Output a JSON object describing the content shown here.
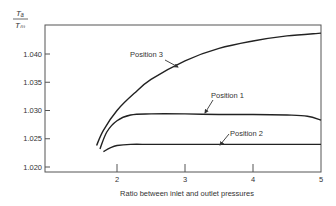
{
  "chart_data": {
    "type": "line",
    "title": "",
    "ylabel_numerator": "Tₐ",
    "ylabel_denominator": "Tₘ",
    "xlabel": "Ratio between inlet and outlet pressures",
    "xlim": [
      1,
      5
    ],
    "ylim": [
      1.02,
      1.046
    ],
    "x_ticks": [
      2,
      3,
      4,
      5
    ],
    "x_tick_labels": [
      "2",
      "3",
      "4",
      "5"
    ],
    "y_ticks": [
      1.02,
      1.025,
      1.03,
      1.035,
      1.04
    ],
    "y_tick_labels": [
      "1.020",
      "1.025",
      "1.030",
      "1.035",
      "1.040"
    ],
    "grid": false,
    "legend": "inline annotations with arrows",
    "series": [
      {
        "name": "Position 3",
        "x": [
          1.7,
          1.8,
          2.0,
          2.25,
          2.5,
          3.0,
          3.5,
          4.0,
          4.5,
          5.0
        ],
        "y": [
          1.0238,
          1.0265,
          1.03,
          1.033,
          1.0355,
          1.0388,
          1.041,
          1.0423,
          1.0432,
          1.0437
        ]
      },
      {
        "name": "Position 1",
        "x": [
          1.75,
          1.85,
          2.0,
          2.2,
          2.5,
          3.0,
          3.5,
          4.0,
          4.5,
          4.8,
          5.0
        ],
        "y": [
          1.0232,
          1.0262,
          1.0282,
          1.0292,
          1.0294,
          1.0294,
          1.0293,
          1.0293,
          1.0292,
          1.029,
          1.0283
        ]
      },
      {
        "name": "Position 2",
        "x": [
          1.8,
          1.9,
          2.0,
          2.2,
          2.5,
          3.0,
          3.5,
          4.0,
          4.5,
          5.0
        ],
        "y": [
          1.0227,
          1.0234,
          1.0238,
          1.024,
          1.024,
          1.024,
          1.024,
          1.024,
          1.024,
          1.024
        ]
      }
    ],
    "annotations": [
      {
        "text": "Position 3",
        "series": "Position 3"
      },
      {
        "text": "Position 1",
        "series": "Position 1"
      },
      {
        "text": "Position 2",
        "series": "Position 2"
      }
    ]
  }
}
